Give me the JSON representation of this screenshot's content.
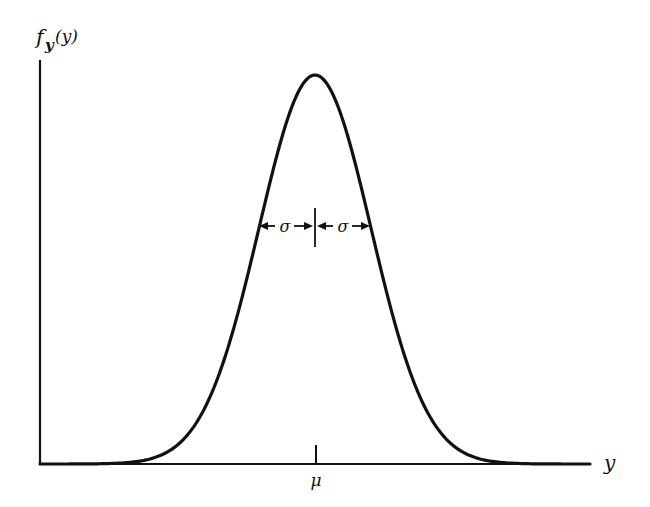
{
  "figure": {
    "y_axis_label": "f",
    "y_axis_label_sub": "y",
    "y_axis_label_arg": "(y)",
    "x_axis_label": "y",
    "mean_label": "μ",
    "sigma_left_label": "σ",
    "sigma_right_label": "σ",
    "curve": "Gaussian (normal) probability density",
    "colors": {
      "ink": "#111111",
      "background": "#ffffff"
    }
  },
  "chart_data": {
    "type": "line",
    "title": "",
    "xlabel": "y",
    "ylabel": "f_y(y)",
    "annotations": [
      "μ (mean, tick on x-axis)",
      "σ to left of mean at ~60% height",
      "σ to right of mean at ~60% height"
    ],
    "series": [
      {
        "name": "normal density",
        "x_in_sigma_units": [
          -5,
          -4,
          -3,
          -2.5,
          -2,
          -1.5,
          -1,
          -0.5,
          0,
          0.5,
          1,
          1.5,
          2,
          2.5,
          3,
          4,
          5
        ],
        "relative_height": [
          0.0,
          0.0003,
          0.011,
          0.044,
          0.135,
          0.325,
          0.607,
          0.882,
          1.0,
          0.882,
          0.607,
          0.325,
          0.135,
          0.044,
          0.011,
          0.0003,
          0.0
        ]
      }
    ],
    "grid": false,
    "legend": "none"
  }
}
